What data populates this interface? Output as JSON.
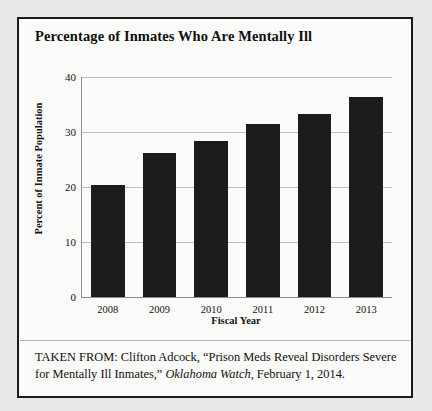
{
  "figure": {
    "title": "Percentage of Inmates Who Are Mentally Ill",
    "caption_prefix": "TAKEN FROM: Clifton Adcock, “Prison Meds Reveal Disorders Severe for Mentally Ill Inmates,” ",
    "caption_source": "Oklahoma Watch",
    "caption_suffix": ", February 1, 2014.",
    "border_color": "#1b1b1b",
    "page_background": "#e9e9e7"
  },
  "chart_data": {
    "type": "bar",
    "title": "Percentage of Inmates Who Are Mentally Ill",
    "categories": [
      "2008",
      "2009",
      "2010",
      "2011",
      "2012",
      "2013"
    ],
    "values": [
      20.3,
      26.1,
      28.3,
      31.5,
      33.2,
      36.3
    ],
    "xlabel": "Fiscal Year",
    "ylabel": "Percent of Inmate Population",
    "ylim": [
      0,
      40
    ],
    "yticks": [
      0,
      10,
      20,
      30,
      40
    ],
    "ytick_labels": [
      "0",
      "10",
      "20",
      "30",
      "40"
    ],
    "grid": true,
    "grid_axis": "y",
    "legend": null,
    "bar_color": "#1c1c1c",
    "gridline_color": "#bfbfbf",
    "axis_color": "#8e8e8e"
  }
}
